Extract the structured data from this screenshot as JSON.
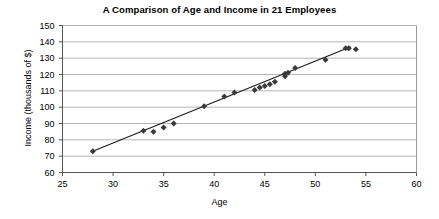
{
  "chart_data": {
    "type": "scatter",
    "title": "A Comparison of Age and Income in 21 Employees",
    "xlabel": "Age",
    "ylabel": "Income (thousands of $)",
    "xlim": [
      25,
      60
    ],
    "ylim": [
      60,
      150
    ],
    "xticks": [
      25,
      30,
      35,
      40,
      45,
      50,
      55,
      60
    ],
    "yticks": [
      60,
      70,
      80,
      90,
      100,
      110,
      120,
      130,
      140,
      150
    ],
    "grid": "horizontal",
    "legend": "none",
    "marker": "diamond",
    "marker_color": "#3a3a3a",
    "trendline": true,
    "trendline_color": "#1a1a1a",
    "points": [
      {
        "x": 28,
        "y": 73
      },
      {
        "x": 33,
        "y": 85.5
      },
      {
        "x": 34,
        "y": 85
      },
      {
        "x": 35,
        "y": 87.5
      },
      {
        "x": 36,
        "y": 90
      },
      {
        "x": 39,
        "y": 100.5
      },
      {
        "x": 41,
        "y": 106.5
      },
      {
        "x": 42,
        "y": 109
      },
      {
        "x": 44,
        "y": 110.5
      },
      {
        "x": 44.5,
        "y": 112
      },
      {
        "x": 45,
        "y": 113
      },
      {
        "x": 45.5,
        "y": 114
      },
      {
        "x": 46,
        "y": 115.5
      },
      {
        "x": 47,
        "y": 119
      },
      {
        "x": 47,
        "y": 120.5
      },
      {
        "x": 47.3,
        "y": 121
      },
      {
        "x": 48,
        "y": 124
      },
      {
        "x": 51,
        "y": 129
      },
      {
        "x": 53,
        "y": 136
      },
      {
        "x": 53.3,
        "y": 136
      },
      {
        "x": 54,
        "y": 135.5
      }
    ],
    "trendline_endpoints": [
      {
        "x": 27.8,
        "y": 72.5
      },
      {
        "x": 53.5,
        "y": 137
      }
    ]
  }
}
